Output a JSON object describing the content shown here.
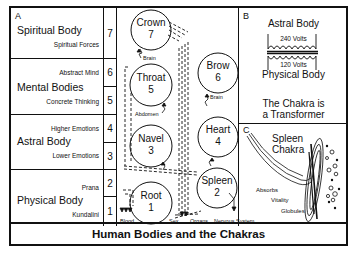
{
  "title": "Human Bodies and the Chakras",
  "panel_a": {
    "letter": "A",
    "bodies": [
      {
        "name": "Spiritual Body",
        "sub": [
          "Spiritual Forces"
        ],
        "numbers": [
          "7"
        ]
      },
      {
        "name": "Mental Bodies",
        "sub": [
          "Abstract Mind",
          "Concrete Thinking"
        ],
        "numbers": [
          "6",
          "5"
        ]
      },
      {
        "name": "Astral Body",
        "sub": [
          "Higher Emotions",
          "Lower Emotions"
        ],
        "numbers": [
          "4",
          "3"
        ]
      },
      {
        "name": "Physical Body",
        "sub": [
          "Prana",
          "Kundalini"
        ],
        "numbers": [
          "2",
          "1"
        ]
      }
    ]
  },
  "chakras": [
    {
      "name": "Crown",
      "number": "7"
    },
    {
      "name": "Throat",
      "number": "5"
    },
    {
      "name": "Navel",
      "number": "3"
    },
    {
      "name": "Root",
      "number": "1"
    },
    {
      "name": "Brow",
      "number": "6"
    },
    {
      "name": "Heart",
      "number": "4"
    },
    {
      "name": "Spleen",
      "number": "2"
    }
  ],
  "connection_labels": {
    "brain_left": "Brain",
    "abdomen": "Abdomen",
    "brain_right": "Brain",
    "blood": "Blood",
    "sex": "Sex",
    "organs": "Organs",
    "nervous_system": "Nervous System"
  },
  "panel_b": {
    "letter": "B",
    "top_label": "Astral Body",
    "top_voltage": "240 Volts",
    "bottom_voltage": "120 Volts",
    "bottom_label": "Physical Body",
    "caption_line1": "The Chakra is",
    "caption_line2": "a Transformer"
  },
  "panel_c": {
    "letter": "C",
    "title_line1": "Spleen",
    "title_line2": "Chakra",
    "labels": [
      "Absorbs",
      "Vitality",
      "Globules"
    ]
  }
}
